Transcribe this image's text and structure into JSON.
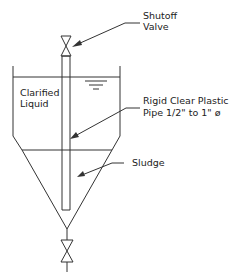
{
  "diagram": {
    "type": "settling-tank-cross-section",
    "line_color": "#333333",
    "background": "#ffffff",
    "labels": {
      "shutoff_valve": [
        "Shutoff",
        "Valve"
      ],
      "clarified_liquid": [
        "Clarified",
        "Liquid"
      ],
      "pipe": [
        "Rigid Clear Plastic",
        "Pipe 1/2\" to 1\" ø"
      ],
      "sludge": "Sludge"
    },
    "icons": {
      "top_valve": "gate-valve-icon",
      "bottom_valve": "gate-valve-icon",
      "water_level": "water-level-symbol-icon"
    }
  }
}
